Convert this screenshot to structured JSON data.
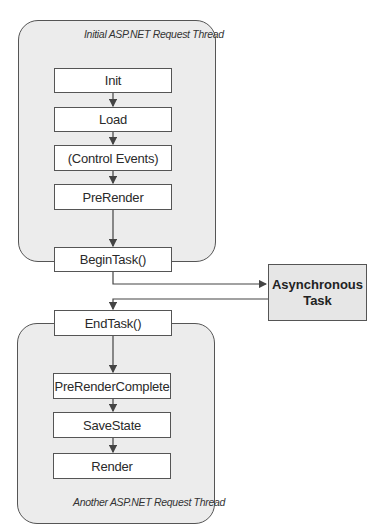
{
  "diagram": {
    "initial_thread": {
      "label": "Initial ASP.NET Request Thread",
      "steps": [
        "Init",
        "Load",
        "(Control Events)",
        "PreRender"
      ]
    },
    "begin_task": "BeginTask()",
    "async_task": {
      "line1": "Asynchronous",
      "line2": "Task"
    },
    "end_task": "EndTask()",
    "another_thread": {
      "label": "Another ASP.NET Request Thread",
      "steps": [
        "PreRenderComplete",
        "SaveState",
        "Render"
      ]
    },
    "colors": {
      "thread_fill": "#ececec",
      "box_fill": "#ffffff",
      "async_fill": "#e6e6e6",
      "stroke": "#555555"
    }
  }
}
